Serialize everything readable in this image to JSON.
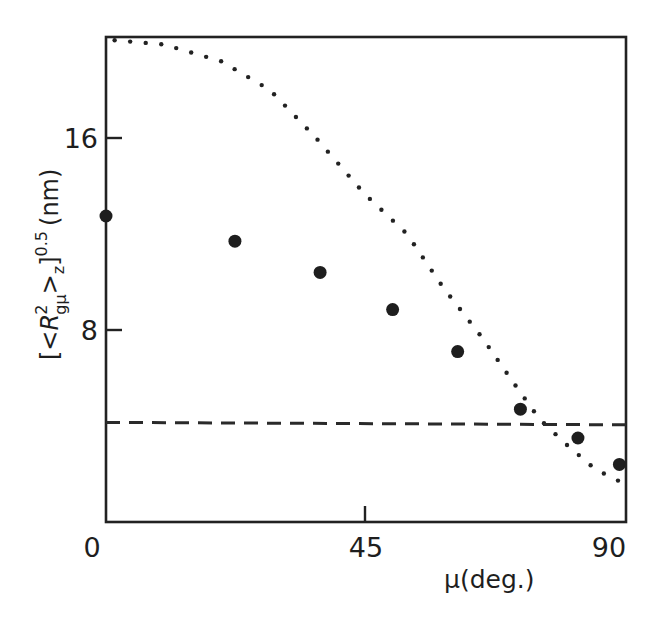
{
  "chart_data": {
    "type": "scatter",
    "title": "",
    "xlabel": "μ(deg.)",
    "ylabel": "[<R²gμ>z]^0.5 (nm)",
    "ylabel_parts": {
      "open": "[<",
      "R": "R",
      "sup2": "2",
      "sub": "gμ",
      "close": ">",
      "subz": "z",
      "bracket": "]",
      "exp": "0.5",
      "unit": "(nm)"
    },
    "xlim": [
      0,
      90
    ],
    "ylim": [
      0,
      20.2
    ],
    "x_ticks": [
      0,
      45,
      90
    ],
    "x_tick_labels": [
      "0",
      "45",
      "90"
    ],
    "y_ticks": [
      8,
      16
    ],
    "y_tick_labels": [
      "8",
      "16"
    ],
    "grid": false,
    "legend": null,
    "series": [
      {
        "name": "measured",
        "style": "filled-circle markers",
        "x": [
          0,
          22.4,
          37.2,
          49.8,
          61.1,
          72.0,
          82.0,
          89.2
        ],
        "y": [
          12.75,
          11.7,
          10.4,
          8.85,
          7.1,
          4.7,
          3.5,
          2.4
        ]
      },
      {
        "name": "dotted-curve",
        "style": "dotted line",
        "x": [
          0,
          10,
          20,
          28.5,
          36.5,
          44.8,
          52.3,
          58.5,
          65.3,
          71.4,
          75.3,
          79.9,
          85,
          90
        ],
        "y": [
          20.1,
          19.9,
          19.2,
          18.0,
          16.0,
          13.7,
          12.0,
          9.8,
          7.7,
          5.6,
          4.3,
          3.25,
          2.2,
          1.6
        ]
      },
      {
        "name": "dashed-line",
        "style": "dashed horizontal line",
        "x": [
          0,
          90
        ],
        "y": [
          4.15,
          4.05
        ]
      }
    ]
  }
}
